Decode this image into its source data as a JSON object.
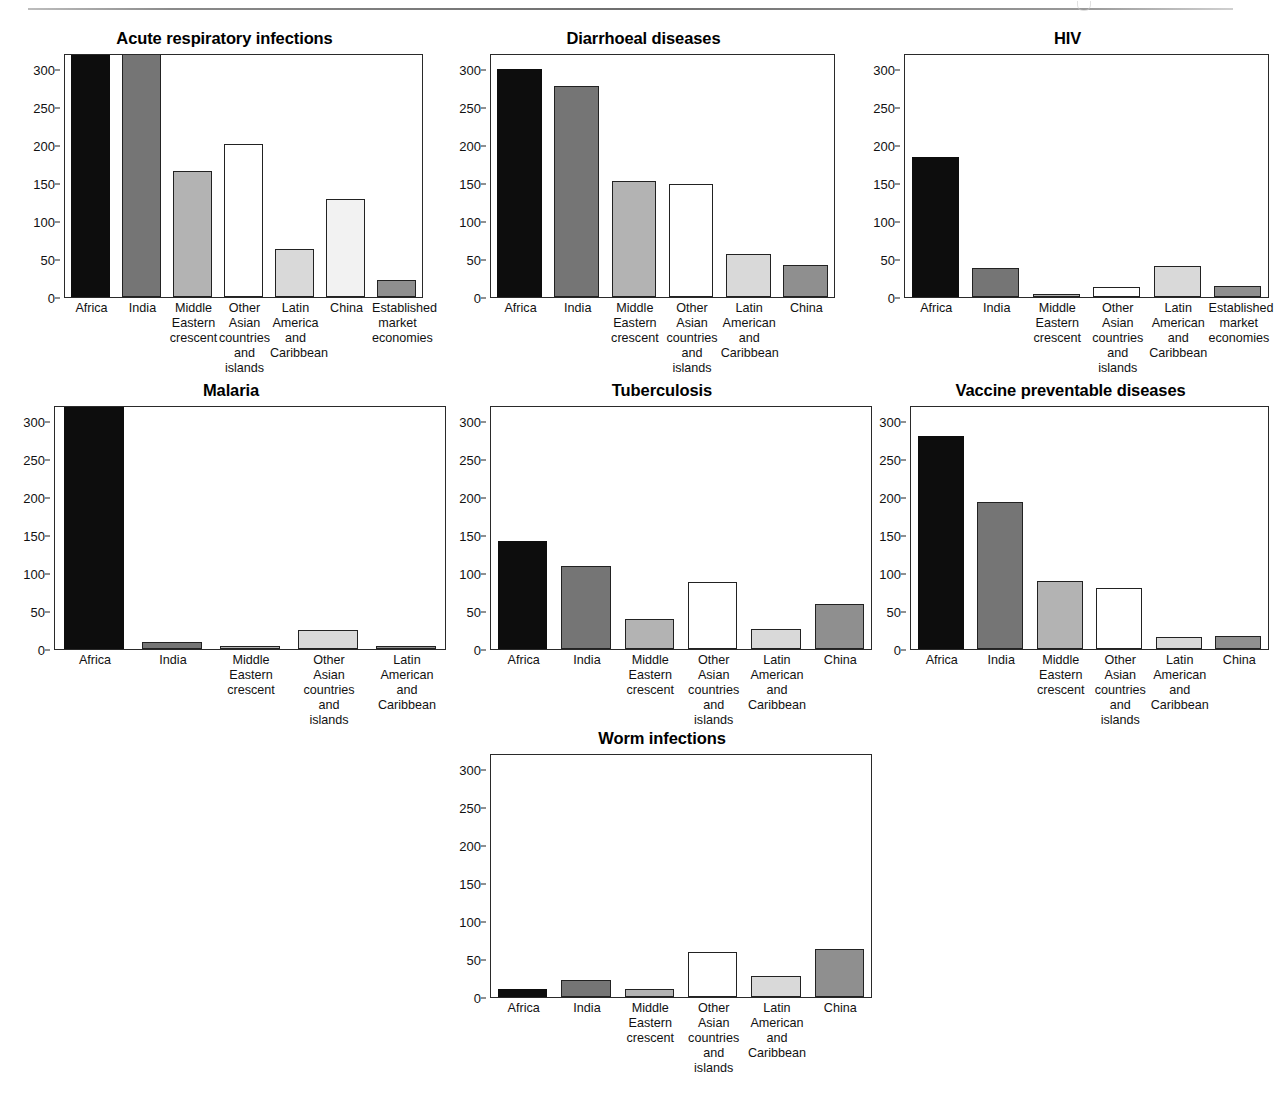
{
  "page": {
    "rule_label": "header-rule",
    "artifact": "page-header-mark"
  },
  "charts": [
    {
      "id": "acute-respiratory-infections",
      "title": "Acute respiratory infections",
      "yticks": [
        "0",
        "50",
        "100",
        "150",
        "200",
        "250",
        "300"
      ],
      "categories": [
        [
          "Africa"
        ],
        [
          "India"
        ],
        [
          "Middle",
          "Eastern",
          "crescent"
        ],
        [
          "Other",
          "Asian",
          "countries",
          "and",
          "islands"
        ],
        [
          "Latin",
          "America",
          "and",
          "Caribbean"
        ],
        [
          "China"
        ],
        [
          "Established",
          "market",
          "economies"
        ]
      ],
      "values": [
        340,
        335,
        166,
        201,
        64,
        129,
        23
      ],
      "fills": [
        "black",
        "darkgray",
        "midgray",
        "white",
        "lightgray",
        "paleg",
        "gray"
      ]
    },
    {
      "id": "diarrhoeal-diseases",
      "title": "Diarrhoeal diseases",
      "yticks": [
        "0",
        "50",
        "100",
        "150",
        "200",
        "250",
        "300"
      ],
      "categories": [
        [
          "Africa"
        ],
        [
          "India"
        ],
        [
          "Middle",
          "Eastern",
          "crescent"
        ],
        [
          "Other",
          "Asian",
          "countries",
          "and",
          "islands"
        ],
        [
          "Latin",
          "American",
          "and",
          "Caribbean"
        ],
        [
          "China"
        ]
      ],
      "values": [
        300,
        277,
        153,
        148,
        57,
        42
      ],
      "fills": [
        "black",
        "darkgray",
        "midgray",
        "white",
        "lightgray",
        "gray"
      ]
    },
    {
      "id": "hiv",
      "title": "HIV",
      "yticks": [
        "0",
        "50",
        "100",
        "150",
        "200",
        "250",
        "300"
      ],
      "categories": [
        [
          "Africa"
        ],
        [
          "India"
        ],
        [
          "Middle",
          "Eastern",
          "crescent"
        ],
        [
          "Other",
          "Asian",
          "countries",
          "and",
          "islands"
        ],
        [
          "Latin",
          "American",
          "and",
          "Caribbean"
        ],
        [
          "Established",
          "market",
          "economies"
        ]
      ],
      "values": [
        184,
        39,
        4,
        13,
        41,
        15
      ],
      "fills": [
        "black",
        "darkgray",
        "midgray",
        "white",
        "lightgray",
        "gray"
      ]
    },
    {
      "id": "malaria",
      "title": "Malaria",
      "yticks": [
        "0",
        "50",
        "100",
        "150",
        "200",
        "250",
        "300"
      ],
      "categories": [
        [
          "Africa"
        ],
        [
          "India"
        ],
        [
          "Middle",
          "Eastern",
          "crescent"
        ],
        [
          "Other",
          "Asian",
          "countries",
          "and",
          "islands"
        ],
        [
          "Latin",
          "American",
          "and",
          "Caribbean"
        ]
      ],
      "values": [
        340,
        10,
        4,
        25,
        5
      ],
      "fills": [
        "black",
        "darkgray",
        "midgray",
        "lightgray",
        "gray"
      ]
    },
    {
      "id": "tuberculosis",
      "title": "Tuberculosis",
      "yticks": [
        "0",
        "50",
        "100",
        "150",
        "200",
        "250",
        "300"
      ],
      "categories": [
        [
          "Africa"
        ],
        [
          "India"
        ],
        [
          "Middle",
          "Eastern",
          "crescent"
        ],
        [
          "Other",
          "Asian",
          "countries",
          "and",
          "islands"
        ],
        [
          "Latin",
          "American",
          "and",
          "Caribbean"
        ],
        [
          "China"
        ]
      ],
      "values": [
        142,
        109,
        40,
        88,
        27,
        59
      ],
      "fills": [
        "black",
        "darkgray",
        "midgray",
        "white",
        "lightgray",
        "gray"
      ]
    },
    {
      "id": "vaccine-preventable-diseases",
      "title": "Vaccine preventable diseases",
      "yticks": [
        "0",
        "50",
        "100",
        "150",
        "200",
        "250",
        "300"
      ],
      "categories": [
        [
          "Africa"
        ],
        [
          "India"
        ],
        [
          "Middle",
          "Eastern",
          "crescent"
        ],
        [
          "Other",
          "Asian",
          "countries",
          "and",
          "islands"
        ],
        [
          "Latin",
          "American",
          "and",
          "Caribbean"
        ],
        [
          "China"
        ]
      ],
      "values": [
        280,
        193,
        89,
        81,
        16,
        18
      ],
      "fills": [
        "black",
        "darkgray",
        "midgray",
        "white",
        "lightgray",
        "gray"
      ]
    },
    {
      "id": "worm-infections",
      "title": "Worm infections",
      "yticks": [
        "0",
        "50",
        "100",
        "150",
        "200",
        "250",
        "300"
      ],
      "categories": [
        [
          "Africa"
        ],
        [
          "India"
        ],
        [
          "Middle",
          "Eastern",
          "crescent"
        ],
        [
          "Other",
          "Asian",
          "countries",
          "and",
          "islands"
        ],
        [
          "Latin",
          "American",
          "and",
          "Caribbean"
        ],
        [
          "China"
        ]
      ],
      "values": [
        11,
        23,
        11,
        59,
        28,
        64
      ],
      "fills": [
        "black",
        "darkgray",
        "midgray",
        "white",
        "lightgray",
        "gray"
      ]
    }
  ],
  "chart_data": {
    "type": "bar",
    "ylabel": "",
    "xlabel": "",
    "ylim": [
      0,
      320
    ],
    "yticks": [
      0,
      50,
      100,
      150,
      200,
      250,
      300
    ],
    "grid": false,
    "legend": "none",
    "panels": [
      {
        "title": "Acute respiratory infections",
        "categories": [
          "Africa",
          "India",
          "Middle Eastern crescent",
          "Other Asian countries and islands",
          "Latin America and Caribbean",
          "China",
          "Established market economies"
        ],
        "values": [
          340,
          335,
          166,
          201,
          64,
          129,
          23
        ],
        "note": "Africa and India bars exceed the axis maximum and are clipped at the frame top"
      },
      {
        "title": "Diarrhoeal diseases",
        "categories": [
          "Africa",
          "India",
          "Middle Eastern crescent",
          "Other Asian countries and islands",
          "Latin American and Caribbean",
          "China"
        ],
        "values": [
          300,
          277,
          153,
          148,
          57,
          42
        ]
      },
      {
        "title": "HIV",
        "categories": [
          "Africa",
          "India",
          "Middle Eastern crescent",
          "Other Asian countries and islands",
          "Latin American and Caribbean",
          "Established market economies"
        ],
        "values": [
          184,
          39,
          4,
          13,
          41,
          15
        ]
      },
      {
        "title": "Malaria",
        "categories": [
          "Africa",
          "India",
          "Middle Eastern crescent",
          "Other Asian countries and islands",
          "Latin American and Caribbean"
        ],
        "values": [
          340,
          10,
          4,
          25,
          5
        ],
        "note": "Africa bar exceeds the axis maximum and is clipped at the frame top"
      },
      {
        "title": "Tuberculosis",
        "categories": [
          "Africa",
          "India",
          "Middle Eastern crescent",
          "Other Asian countries and islands",
          "Latin American and Caribbean",
          "China"
        ],
        "values": [
          142,
          109,
          40,
          88,
          27,
          59
        ]
      },
      {
        "title": "Vaccine preventable diseases",
        "categories": [
          "Africa",
          "India",
          "Middle Eastern crescent",
          "Other Asian countries and islands",
          "Latin American and Caribbean",
          "China"
        ],
        "values": [
          280,
          193,
          89,
          81,
          16,
          18
        ]
      },
      {
        "title": "Worm infections",
        "categories": [
          "Africa",
          "India",
          "Middle Eastern crescent",
          "Other Asian countries and islands",
          "Latin American and Caribbean",
          "China"
        ],
        "values": [
          11,
          23,
          11,
          59,
          28,
          64
        ]
      }
    ]
  }
}
